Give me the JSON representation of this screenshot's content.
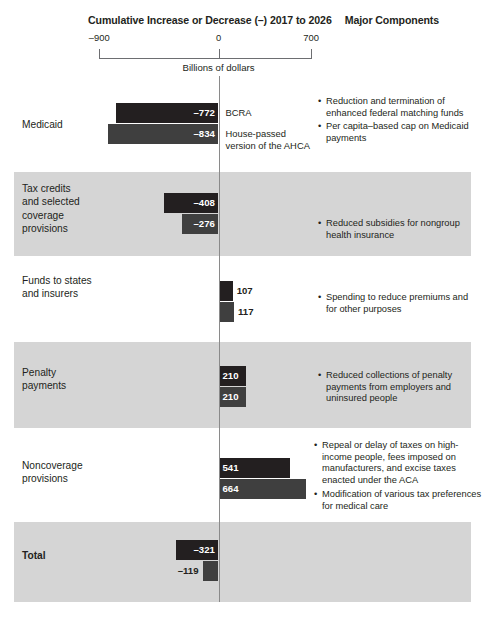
{
  "header": {
    "title": "Cumulative Increase or Decrease (–) 2017 to 2026",
    "major_components": "Major Components",
    "units": "Billions of dollars",
    "axis_ticks": [
      "–900",
      "0",
      "700"
    ]
  },
  "chart_data": {
    "type": "bar",
    "title": "Cumulative Increase or Decrease (–) 2017 to 2026",
    "xlabel": "Billions of dollars",
    "ylabel": "",
    "orientation": "horizontal",
    "grid": false,
    "xlim": [
      -900,
      700
    ],
    "xticks": [
      -900,
      0,
      700
    ],
    "legend_position": "inline-right-of-bars",
    "series": [
      {
        "name": "BCRA",
        "values": [
          -772,
          -408,
          107,
          210,
          541,
          -321
        ]
      },
      {
        "name": "House-passed version of the AHCA",
        "values": [
          -834,
          -276,
          117,
          210,
          664,
          -119
        ]
      }
    ],
    "categories": [
      "Medicaid",
      "Tax credits and selected coverage provisions",
      "Funds to states and insurers",
      "Penalty payments",
      "Noncoverage provisions",
      "Total"
    ]
  },
  "rows": [
    {
      "label": "Medicaid",
      "bold": false,
      "shaded": false,
      "bars": [
        {
          "value": -772,
          "label": "–772",
          "series": "BCRA"
        },
        {
          "value": -834,
          "label": "–834",
          "series": "House-passed version of the AHCA"
        }
      ],
      "series_notes": [
        "BCRA",
        "House-passed\nversion of the AHCA"
      ],
      "bullets": [
        "Reduction and termination of enhanced federal matching funds",
        "Per capita–based cap on Medicaid payments"
      ]
    },
    {
      "label": "Tax credits\nand selected\ncoverage\nprovisions",
      "bold": false,
      "shaded": true,
      "bars": [
        {
          "value": -408,
          "label": "–408",
          "series": "BCRA"
        },
        {
          "value": -276,
          "label": "–276",
          "series": "House-passed version of the AHCA"
        }
      ],
      "series_notes": [],
      "bullets": [
        "Reduced subsidies for nongroup health insurance"
      ]
    },
    {
      "label": "Funds to states\nand insurers",
      "bold": false,
      "shaded": false,
      "bars": [
        {
          "value": 107,
          "label": "107",
          "series": "BCRA"
        },
        {
          "value": 117,
          "label": "117",
          "series": "House-passed version of the AHCA"
        }
      ],
      "series_notes": [],
      "bullets": [
        "Spending to reduce premiums and for other purposes"
      ]
    },
    {
      "label": "Penalty\npayments",
      "bold": false,
      "shaded": true,
      "bars": [
        {
          "value": 210,
          "label": "210",
          "series": "BCRA"
        },
        {
          "value": 210,
          "label": "210",
          "series": "House-passed version of the AHCA"
        }
      ],
      "series_notes": [],
      "bullets": [
        "Reduced collections of penalty payments from employers and uninsured people"
      ]
    },
    {
      "label": "Noncoverage\nprovisions",
      "bold": false,
      "shaded": false,
      "bars": [
        {
          "value": 541,
          "label": "541",
          "series": "BCRA"
        },
        {
          "value": 664,
          "label": "664",
          "series": "House-passed version of the AHCA"
        }
      ],
      "series_notes": [],
      "bullets": [
        "Repeal or delay of taxes on high-income people, fees imposed on manufacturers, and excise taxes enacted under the ACA",
        "Modification of various tax preferences for medical care"
      ]
    },
    {
      "label": "Total",
      "bold": true,
      "shaded": true,
      "bars": [
        {
          "value": -321,
          "label": "–321",
          "series": "BCRA"
        },
        {
          "value": -119,
          "label": "–119",
          "series": "House-passed version of the AHCA"
        }
      ],
      "series_notes": [],
      "bullets": []
    }
  ],
  "colors": {
    "bcra_bar": "#231f20",
    "ahca_bar": "#3f3f3f",
    "band_shade": "#d5d5d5",
    "axis": "#6d6e71",
    "zero_line": "#8a8a8a",
    "text": "#231f20"
  }
}
